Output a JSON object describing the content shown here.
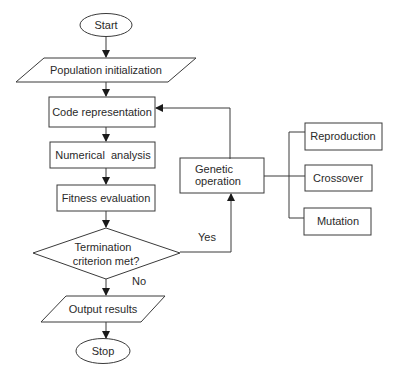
{
  "diagram": {
    "type": "flowchart",
    "nodes": {
      "start": {
        "label": "Start",
        "shape": "ellipse"
      },
      "population_init": {
        "label": "Population initialization",
        "shape": "parallelogram"
      },
      "code_rep": {
        "label": "Code representation",
        "shape": "rectangle"
      },
      "numerical": {
        "label": "Numerical  analysis",
        "shape": "rectangle"
      },
      "fitness": {
        "label": "Fitness evaluation",
        "shape": "rectangle"
      },
      "termination": {
        "label_line1": "Termination",
        "label_line2": "criterion met?",
        "shape": "diamond"
      },
      "output": {
        "label": "Output results",
        "shape": "parallelogram"
      },
      "stop": {
        "label": "Stop",
        "shape": "ellipse"
      },
      "genetic_op": {
        "label_line1": "Genetic",
        "label_line2": "operation",
        "shape": "rectangle"
      },
      "reproduction": {
        "label": "Reproduction",
        "shape": "rectangle"
      },
      "crossover": {
        "label": "Crossover",
        "shape": "rectangle"
      },
      "mutation": {
        "label": "Mutation",
        "shape": "rectangle"
      }
    },
    "edge_labels": {
      "yes": "Yes",
      "no": "No"
    },
    "colors": {
      "stroke": "#3a3a3a",
      "text": "#2a2a2a",
      "background": "#ffffff"
    }
  }
}
